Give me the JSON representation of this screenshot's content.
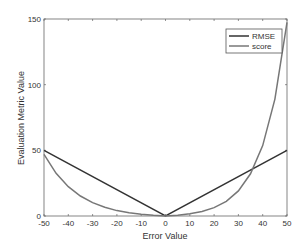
{
  "chart_data": {
    "type": "line",
    "title": "",
    "xlabel": "Error Value",
    "ylabel": "Evaluation Metric Value",
    "xlim": [
      -50,
      50
    ],
    "ylim": [
      0,
      150
    ],
    "xticks": [
      -50,
      -40,
      -30,
      -20,
      -10,
      0,
      10,
      20,
      30,
      40,
      50
    ],
    "yticks": [
      0,
      50,
      100,
      150
    ],
    "grid": false,
    "legend_position": "upper right",
    "series": [
      {
        "name": "RMSE",
        "color": "#333333",
        "x": [
          -50,
          0,
          50
        ],
        "y": [
          50,
          0,
          50
        ]
      },
      {
        "name": "score",
        "color": "#777777",
        "x": [
          -50,
          -45,
          -40,
          -35,
          -30,
          -25,
          -20,
          -15,
          -10,
          -5,
          0,
          5,
          10,
          15,
          20,
          25,
          30,
          35,
          40,
          45,
          50
        ],
        "y": [
          47.0,
          32.5,
          22.3,
          15.2,
          10.2,
          6.6,
          4.1,
          2.4,
          1.3,
          0.5,
          0,
          0.6,
          1.7,
          3.5,
          6.4,
          11.2,
          19.1,
          32.1,
          53.6,
          89.0,
          147.4
        ]
      }
    ]
  }
}
